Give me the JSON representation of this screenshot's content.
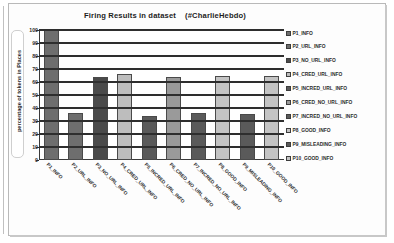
{
  "chart_data": {
    "type": "bar",
    "title": "Firing Results in dataset    (#CharlieHebdo)",
    "xlabel": "",
    "ylabel": "percentage of tokens in  Places",
    "ylim": [
      0,
      100
    ],
    "ytick_labels": [
      "100",
      "90",
      "80",
      "70",
      "60",
      "50",
      "40",
      "30",
      "20",
      "10",
      "0"
    ],
    "ytick_values": [
      100,
      90,
      80,
      70,
      60,
      50,
      40,
      30,
      20,
      10,
      0
    ],
    "grid": true,
    "legend_position": "right",
    "categories": [
      "P1_INFO",
      "P2_URL_INFO",
      "P3_NO_URL_INFO",
      "P4_CRED_URL_INFO",
      "P5_INCRED_URL_INFO",
      "P6_CRED_NO_URL_INFO",
      "P7_INCRED_NO_URL_INFO",
      "P8_GOOD_INFO",
      "P9_MISLEADING_INFO",
      "P10_GOOD_INFO"
    ],
    "values": [
      100,
      36,
      64,
      66,
      34,
      64,
      36,
      64.5,
      35.5,
      64.5
    ],
    "bar_colors": [
      "#6e6e6e",
      "#6e6e6e",
      "#4a4a4a",
      "#bdbdbd",
      "#5a5a5a",
      "#9a9a9a",
      "#5a5a5a",
      "#c4c4c4",
      "#5a5a5a",
      "#c4c4c4"
    ],
    "legend": [
      {
        "label": "P1_INFO",
        "color": "#6e6e6e"
      },
      {
        "label": "P2_URL_INFO",
        "color": "#6e6e6e"
      },
      {
        "label": "P3_NO_URL_INFO",
        "color": "#4a4a4a"
      },
      {
        "label": "P4_CRED_URL_INFO",
        "color": "#bdbdbd"
      },
      {
        "label": "P5_INCRED_URL_INFO",
        "color": "#5a5a5a"
      },
      {
        "label": "P6_CRED_NO_URL_INFO",
        "color": "#9a9a9a"
      },
      {
        "label": "P7_INCRED_NO_URL_INFO",
        "color": "#5a5a5a"
      },
      {
        "label": "P8_GOOD_INFO",
        "color": "#c4c4c4"
      },
      {
        "label": "P9_MISLEADING_INFO",
        "color": "#5a5a5a"
      },
      {
        "label": "P10_GOOD_INFO",
        "color": "#c4c4c4"
      }
    ]
  }
}
